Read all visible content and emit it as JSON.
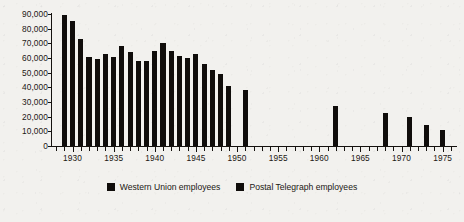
{
  "chart_data": {
    "type": "bar",
    "title": "",
    "subtitle": "",
    "xlabel": "",
    "ylabel": "",
    "xlim": [
      1927.5,
      1976.5
    ],
    "ylim": [
      0,
      90000
    ],
    "grid": false,
    "legend_position": "bottom-center",
    "y_ticks": [
      0,
      10000,
      20000,
      30000,
      40000,
      50000,
      60000,
      70000,
      80000,
      90000
    ],
    "y_tick_labels": [
      "0",
      "10,000",
      "20,000",
      "30,000",
      "40,000",
      "50,000",
      "60,000",
      "70,000",
      "80,000",
      "90,000"
    ],
    "x_ticks": [
      1928,
      1929,
      1930,
      1931,
      1932,
      1933,
      1934,
      1935,
      1936,
      1937,
      1938,
      1939,
      1940,
      1941,
      1942,
      1943,
      1944,
      1945,
      1946,
      1947,
      1948,
      1949,
      1950,
      1951,
      1952,
      1953,
      1954,
      1955,
      1956,
      1957,
      1958,
      1959,
      1960,
      1961,
      1962,
      1963,
      1964,
      1965,
      1966,
      1967,
      1968,
      1969,
      1970,
      1971,
      1972,
      1973,
      1974,
      1975,
      1976
    ],
    "x_tick_labels_major": [
      "1930",
      "1935",
      "1940",
      "1945",
      "1950",
      "1955",
      "1960",
      "1965",
      "1970",
      "1975"
    ],
    "x_major_ticks": [
      1930,
      1935,
      1940,
      1945,
      1950,
      1955,
      1960,
      1965,
      1970,
      1975
    ],
    "series": [
      {
        "name": "Western Union employees",
        "color": "#100d0b",
        "x": [
          1929,
          1930,
          1931,
          1932,
          1933,
          1934,
          1935,
          1936,
          1937,
          1938,
          1939,
          1940,
          1941,
          1942,
          1943,
          1944,
          1945,
          1946,
          1947,
          1948,
          1949,
          1951
        ],
        "values": [
          89000,
          85000,
          73000,
          61000,
          59000,
          62500,
          61000,
          68500,
          64000,
          58000,
          58000,
          65000,
          70500,
          64500,
          61500,
          60000,
          62500,
          56000,
          52000,
          49000,
          41000,
          38500
        ]
      },
      {
        "name": "Postal Telegraph employees",
        "color": "#100d0b",
        "x": [
          1962,
          1968,
          1971,
          1973,
          1975
        ],
        "values": [
          27000,
          22500,
          20000,
          14000,
          11000
        ]
      }
    ],
    "bars": [
      {
        "x": 1929,
        "value": 89000,
        "series": "Western Union employees"
      },
      {
        "x": 1930,
        "value": 85000,
        "series": "Western Union employees"
      },
      {
        "x": 1931,
        "value": 73000,
        "series": "Western Union employees"
      },
      {
        "x": 1932,
        "value": 61000,
        "series": "Western Union employees"
      },
      {
        "x": 1933,
        "value": 59000,
        "series": "Western Union employees"
      },
      {
        "x": 1934,
        "value": 62500,
        "series": "Western Union employees"
      },
      {
        "x": 1935,
        "value": 61000,
        "series": "Western Union employees"
      },
      {
        "x": 1936,
        "value": 68500,
        "series": "Western Union employees"
      },
      {
        "x": 1937,
        "value": 64000,
        "series": "Western Union employees"
      },
      {
        "x": 1938,
        "value": 58000,
        "series": "Western Union employees"
      },
      {
        "x": 1939,
        "value": 58000,
        "series": "Western Union employees"
      },
      {
        "x": 1940,
        "value": 65000,
        "series": "Western Union employees"
      },
      {
        "x": 1941,
        "value": 70500,
        "series": "Western Union employees"
      },
      {
        "x": 1942,
        "value": 64500,
        "series": "Western Union employees"
      },
      {
        "x": 1943,
        "value": 61500,
        "series": "Western Union employees"
      },
      {
        "x": 1944,
        "value": 60000,
        "series": "Western Union employees"
      },
      {
        "x": 1945,
        "value": 62500,
        "series": "Western Union employees"
      },
      {
        "x": 1946,
        "value": 56000,
        "series": "Western Union employees"
      },
      {
        "x": 1947,
        "value": 52000,
        "series": "Western Union employees"
      },
      {
        "x": 1948,
        "value": 49000,
        "series": "Western Union employees"
      },
      {
        "x": 1949,
        "value": 41000,
        "series": "Western Union employees"
      },
      {
        "x": 1951,
        "value": 38500,
        "series": "Western Union employees"
      },
      {
        "x": 1962,
        "value": 27000,
        "series": "Postal Telegraph employees"
      },
      {
        "x": 1968,
        "value": 22500,
        "series": "Postal Telegraph employees"
      },
      {
        "x": 1971,
        "value": 20000,
        "series": "Postal Telegraph employees"
      },
      {
        "x": 1973,
        "value": 14000,
        "series": "Postal Telegraph employees"
      },
      {
        "x": 1975,
        "value": 11000,
        "series": "Postal Telegraph employees"
      }
    ]
  },
  "legend": {
    "items": [
      {
        "label": "Western Union employees",
        "color": "#100d0b"
      },
      {
        "label": "Postal Telegraph employees",
        "color": "#100d0b"
      }
    ]
  }
}
